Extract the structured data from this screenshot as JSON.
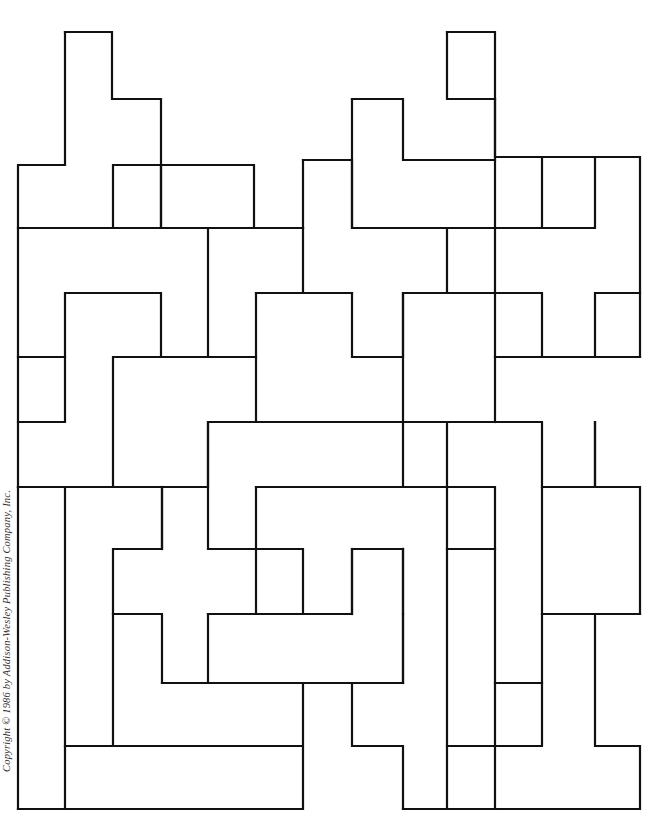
{
  "diagram": {
    "type": "pentomino-tiling-puzzle",
    "line_color": "#111111",
    "background": "#ffffff",
    "segments": [
      "M65 32 H112 V99 H161 V165",
      "M65 32 V165 H18 V228 H113",
      "M18 228 V357 H65 V293 H161 V357",
      "M113 165 H161 V228 H113 Z",
      "M161 165 V228 H208 V357 H161",
      "M161 165 H254 V228 H303 V160",
      "M208 228 H303",
      "M303 160 H352 V228",
      "M352 99 H403 V160 H447",
      "M352 99 V228 H447 V293",
      "M447 32 H495 V99",
      "M447 32 V99 H495 V160 H447",
      "M495 99 V157 H542 V228",
      "M542 157 H640 V357",
      "M595 157 V228 H495 V293",
      "M495 160 V228",
      "M447 228 H495",
      "M303 228 V293 H352 V357 H403 V293",
      "M256 293 H352",
      "M256 293 V422 H403 V293 H495",
      "M256 357 H113 V487",
      "M18 357 V422 H65 V357",
      "M18 422 V487 H208 V422 H256",
      "M495 293 V422",
      "M495 293 H542 V357 H595 V293 H640",
      "M495 357 H640",
      "M403 422 H447 V487",
      "M403 422 V487 H256 V549 H208 V422",
      "M447 422 H542 V487 H595 V422",
      "M595 422 V487 H640 V614",
      "M542 487 V683",
      "M18 487 V809",
      "M65 487 V746",
      "M18 487 H162 V549 H113 V746",
      "M162 487 V549",
      "M256 549 H303 V614 H352 V549 H403",
      "M256 487 H495 V549 H447",
      "M352 549 V614",
      "M403 549 V614",
      "M447 487 V809",
      "M113 614 H162 V683 H208 V614 H256 V549",
      "M208 614 H303",
      "M403 614 V683 H352",
      "M162 683 H303 V746 H65 V809 H303 V746",
      "M208 683 H403",
      "M352 683 V746 H403 V809",
      "M403 549 V683",
      "M495 549 V746 H447",
      "M542 614 H640",
      "M595 614 V746 H640 V809 H495 V746 H542 V683 H495",
      "M18 809 H65",
      "M403 809 H447 H495"
    ]
  },
  "copyright_text": "Copyright © 1986 by Addison-Wesley Publishing Company, Inc."
}
